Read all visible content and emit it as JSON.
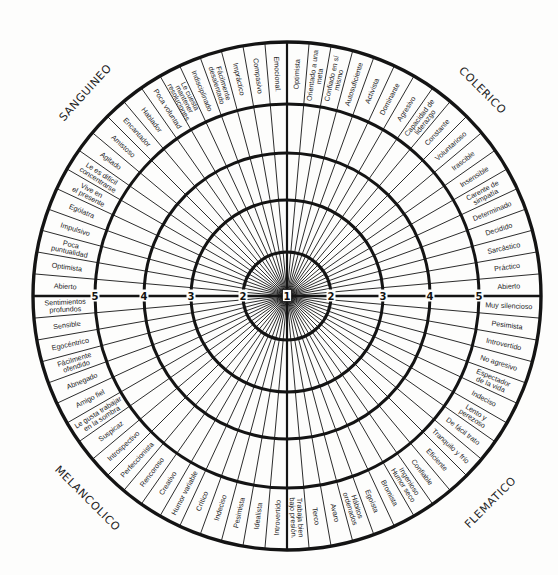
{
  "scale_labels": [
    "1",
    "2",
    "3",
    "4",
    "5"
  ],
  "colors": {
    "line": "#141414",
    "text": "#1c1c1c",
    "background": "#fdfdfc"
  },
  "quadrants": [
    {
      "name": "SANGUINEO",
      "position": "top-left",
      "traits": [
        [
          "Emocional."
        ],
        [
          "Compasivo"
        ],
        [
          "Impráctico"
        ],
        [
          "Fácilmente",
          "desalentado"
        ],
        [
          "Indisciplinado"
        ],
        [
          "Le cuesta",
          "mantener",
          "resoluciones"
        ],
        [
          "Poca voluntad"
        ],
        [
          "Hablador"
        ],
        [
          "Encantador"
        ],
        [
          "Amistoso"
        ],
        [
          "Agitado"
        ],
        [
          "Le es difícil",
          "concentrarse"
        ],
        [
          "Vive en",
          "el presente"
        ],
        [
          "Ególatra"
        ],
        [
          "Impulsivo"
        ],
        [
          "Poca",
          "puntualidad"
        ],
        [
          "Optimista"
        ],
        [
          "Abierto"
        ]
      ]
    },
    {
      "name": "COLERICO",
      "position": "top-right",
      "traits": [
        [
          "Optimista"
        ],
        [
          "Orientado a una",
          "meta"
        ],
        [
          "Confiado en sí",
          "mismo"
        ],
        [
          "Autosuficiente"
        ],
        [
          "Activista"
        ],
        [
          "Dominante"
        ],
        [
          "Agresivo"
        ],
        [
          "Capacidad de",
          "liderazgo"
        ],
        [
          "Constante"
        ],
        [
          "Voluntarioso"
        ],
        [
          "Irascible"
        ],
        [
          "Insensible"
        ],
        [
          "Carente de",
          "simpatía"
        ],
        [
          "Determinado"
        ],
        [
          "Decidido"
        ],
        [
          "Sarcástico"
        ],
        [
          "Práctico"
        ],
        [
          "Abierto"
        ]
      ]
    },
    {
      "name": "FLEMATICO",
      "position": "bottom-right",
      "traits": [
        [
          "Muy silencioso"
        ],
        [
          "Pesimista"
        ],
        [
          "Introvertido"
        ],
        [
          "No agresivo"
        ],
        [
          "Espectador",
          "de la vida"
        ],
        [
          "Indeciso"
        ],
        [
          "Lento y",
          "perezoso"
        ],
        [
          "De fácil trato"
        ],
        [
          "Tranquilo y frío"
        ],
        [
          "Eficiente"
        ],
        [
          "Confiable"
        ],
        [
          "Ingenioso",
          "Humor seco"
        ],
        [
          "Bromista"
        ],
        [
          "Egoísta"
        ],
        [
          "Hábitos",
          "ordenados"
        ],
        [
          "Avaro"
        ],
        [
          "Terco"
        ],
        [
          "Trabaja bien",
          "bajo presión."
        ]
      ]
    },
    {
      "name": "MELANCOLICO",
      "position": "bottom-left",
      "traits": [
        [
          "Sentimientos",
          "profundos"
        ],
        [
          "Sensible"
        ],
        [
          "Egocéntrico"
        ],
        [
          "Fácilmente",
          "ofendido"
        ],
        [
          "Abnegado"
        ],
        [
          "Amigo fiel"
        ],
        [
          "Le gusta trabajar",
          "en la sombra"
        ],
        [
          "Suspicaz"
        ],
        [
          "Introspectivo"
        ],
        [
          "Perfeccionista"
        ],
        [
          "Rencoroso"
        ],
        [
          "Creativo"
        ],
        [
          "Humor variable"
        ],
        [
          "Crítico"
        ],
        [
          "Indeciso"
        ],
        [
          "Pesimista"
        ],
        [
          "Idealista"
        ],
        [
          "Introvertido"
        ]
      ]
    }
  ]
}
